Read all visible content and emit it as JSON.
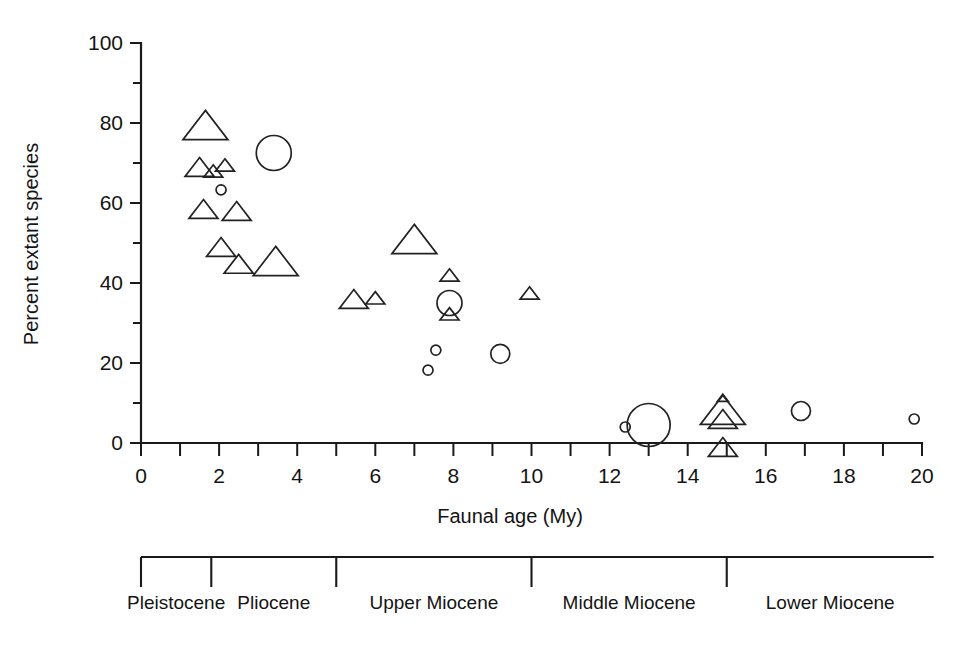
{
  "chart_data": {
    "type": "scatter",
    "title": "",
    "xlabel": "Faunal age (My)",
    "ylabel": "Percent extant species",
    "xlim": [
      0,
      20
    ],
    "ylim": [
      0,
      100
    ],
    "xticks": [
      0,
      2,
      4,
      6,
      8,
      10,
      12,
      14,
      16,
      18,
      20
    ],
    "xtick_labels": [
      "0",
      "2",
      "4",
      "6",
      "8",
      "10",
      "12",
      "14",
      "16",
      "18",
      "20"
    ],
    "x_minor_tick_step": 1,
    "yticks": [
      0,
      20,
      40,
      60,
      80,
      100
    ],
    "ytick_labels": [
      "0",
      "20",
      "40",
      "60",
      "80",
      "100"
    ],
    "y_minor_tick_step": 10,
    "grid": false,
    "legend": null,
    "marker_shapes": [
      "triangle",
      "circle"
    ],
    "marker_note": "Marker area scales with sample size; triangles and circles denote two faunal groups.",
    "series": [
      {
        "name": "triangle",
        "shape": "triangle",
        "points": [
          {
            "x": 1.65,
            "y": 79.5,
            "size": "large"
          },
          {
            "x": 1.5,
            "y": 69.0,
            "size": "medium"
          },
          {
            "x": 1.85,
            "y": 68.0,
            "size": "small"
          },
          {
            "x": 2.15,
            "y": 69.5,
            "size": "small"
          },
          {
            "x": 1.6,
            "y": 58.5,
            "size": "medium"
          },
          {
            "x": 2.45,
            "y": 58.0,
            "size": "medium"
          },
          {
            "x": 2.05,
            "y": 49.0,
            "size": "medium"
          },
          {
            "x": 2.5,
            "y": 44.8,
            "size": "medium"
          },
          {
            "x": 3.45,
            "y": 45.5,
            "size": "large"
          },
          {
            "x": 5.45,
            "y": 36.0,
            "size": "medium"
          },
          {
            "x": 6.0,
            "y": 36.3,
            "size": "small"
          },
          {
            "x": 7.0,
            "y": 51.0,
            "size": "large"
          },
          {
            "x": 7.9,
            "y": 42.0,
            "size": "small"
          },
          {
            "x": 7.9,
            "y": 32.3,
            "size": "small"
          },
          {
            "x": 9.95,
            "y": 37.5,
            "size": "small"
          },
          {
            "x": 14.9,
            "y": 11.3,
            "size": "tiny"
          },
          {
            "x": 14.9,
            "y": 8.3,
            "size": "large"
          },
          {
            "x": 14.9,
            "y": 6.0,
            "size": "medium"
          },
          {
            "x": 14.9,
            "y": -1.0,
            "size": "medium"
          }
        ]
      },
      {
        "name": "circle",
        "shape": "circle",
        "points": [
          {
            "x": 3.4,
            "y": 72.5,
            "size": "large"
          },
          {
            "x": 2.05,
            "y": 63.3,
            "size": "tiny"
          },
          {
            "x": 7.9,
            "y": 35.0,
            "size": "medium"
          },
          {
            "x": 7.55,
            "y": 23.2,
            "size": "tiny"
          },
          {
            "x": 7.35,
            "y": 18.2,
            "size": "tiny"
          },
          {
            "x": 9.2,
            "y": 22.3,
            "size": "small"
          },
          {
            "x": 12.4,
            "y": 4.0,
            "size": "tiny"
          },
          {
            "x": 13.0,
            "y": 4.5,
            "size": "xlarge"
          },
          {
            "x": 16.9,
            "y": 8.0,
            "size": "small"
          },
          {
            "x": 19.8,
            "y": 6.0,
            "size": "tiny"
          }
        ]
      }
    ]
  },
  "timescale": {
    "label": "geologic-epoch-scale",
    "epochs": [
      {
        "name": "Pleistocene",
        "start_my": 0.0,
        "end_my": 1.8
      },
      {
        "name": "Pliocene",
        "start_my": 1.8,
        "end_my": 5.0
      },
      {
        "name": "Upper Miocene",
        "start_my": 5.0,
        "end_my": 10.0
      },
      {
        "name": "Middle Miocene",
        "start_my": 10.0,
        "end_my": 15.0
      },
      {
        "name": "Lower Miocene",
        "start_my": 15.0,
        "end_my": 20.3
      }
    ]
  }
}
